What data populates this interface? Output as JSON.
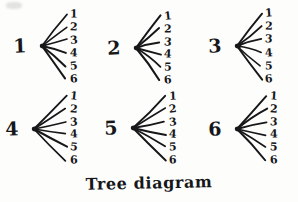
{
  "figure": {
    "caption": "Tree diagram",
    "style": "hand-drawn pen on paper",
    "ink_color": "#17171a",
    "paper_color": "#fdfdfc",
    "width": 298,
    "height": 202
  },
  "diagram_data": {
    "type": "tree",
    "description": "Six separate one-level tree diagrams arranged in a 2-row by 3-column grid. Each root node is labeled with a digit 1 through 6 and fans out to six branches whose endpoints are labeled 1 through 6.",
    "rows": 2,
    "columns": 3,
    "branches_per_node": 6,
    "leaf_labels": [
      "1",
      "2",
      "3",
      "4",
      "5",
      "6"
    ],
    "trees": [
      {
        "root_label": "1",
        "node_x": 40,
        "node_y": 46,
        "leaf_x": 70,
        "leaf_top": 14,
        "leaf_bottom": 79,
        "leaves": [
          "1",
          "2",
          "3",
          "4",
          "5",
          "6"
        ]
      },
      {
        "root_label": "2",
        "node_x": 134,
        "node_y": 48,
        "leaf_x": 164,
        "leaf_top": 16,
        "leaf_bottom": 80,
        "leaves": [
          "1",
          "2",
          "3",
          "4",
          "5",
          "6"
        ]
      },
      {
        "root_label": "3",
        "node_x": 235,
        "node_y": 46,
        "leaf_x": 265,
        "leaf_top": 13,
        "leaf_bottom": 79,
        "leaves": [
          "1",
          "2",
          "3",
          "4",
          "5",
          "6"
        ]
      },
      {
        "root_label": "4",
        "node_x": 32,
        "node_y": 129,
        "leaf_x": 70,
        "leaf_top": 96,
        "leaf_bottom": 160,
        "leaves": [
          "1",
          "2",
          "3",
          "4",
          "5",
          "6"
        ]
      },
      {
        "root_label": "5",
        "node_x": 131,
        "node_y": 128,
        "leaf_x": 169,
        "leaf_top": 96,
        "leaf_bottom": 160,
        "leaves": [
          "1",
          "2",
          "3",
          "4",
          "5",
          "6"
        ]
      },
      {
        "root_label": "6",
        "node_x": 235,
        "node_y": 129,
        "leaf_x": 270,
        "leaf_top": 96,
        "leaf_bottom": 160,
        "leaves": [
          "1",
          "2",
          "3",
          "4",
          "5",
          "6"
        ]
      }
    ]
  }
}
